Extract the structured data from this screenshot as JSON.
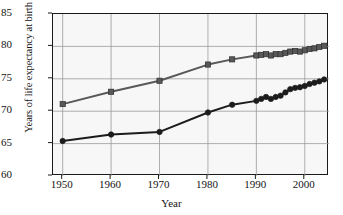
{
  "chart_data": {
    "type": "line",
    "title": "",
    "xlabel": "Year",
    "ylabel": "Years of life expectancy at birth",
    "xlim": [
      1948,
      2005
    ],
    "ylim": [
      60,
      85
    ],
    "xticks": [
      1950,
      1960,
      1970,
      1980,
      1990,
      2000
    ],
    "yticks": [
      60,
      65,
      70,
      75,
      80,
      85
    ],
    "grid": true,
    "legend": "none",
    "plot_background": "#f7f7f7",
    "series": [
      {
        "name": "Upper series (square markers)",
        "color": "#585858",
        "marker": "square",
        "x": [
          1950,
          1960,
          1970,
          1980,
          1985,
          1990,
          1991,
          1992,
          1993,
          1994,
          1995,
          1996,
          1997,
          1998,
          1999,
          2000,
          2001,
          2002,
          2003,
          2004
        ],
        "values": [
          71.1,
          73.0,
          74.7,
          77.2,
          78.0,
          78.6,
          78.7,
          78.8,
          78.6,
          78.8,
          78.8,
          79.0,
          79.2,
          79.3,
          79.2,
          79.4,
          79.6,
          79.7,
          79.9,
          80.1
        ]
      },
      {
        "name": "Lower series (circle markers)",
        "color": "#1c1c1c",
        "marker": "circle",
        "x": [
          1950,
          1960,
          1970,
          1980,
          1985,
          1990,
          1991,
          1992,
          1993,
          1994,
          1995,
          1996,
          1997,
          1998,
          1999,
          2000,
          2001,
          2002,
          2003,
          2004
        ],
        "values": [
          65.4,
          66.4,
          66.8,
          69.8,
          71.0,
          71.6,
          71.9,
          72.2,
          71.9,
          72.2,
          72.4,
          72.9,
          73.4,
          73.6,
          73.7,
          73.9,
          74.2,
          74.4,
          74.6,
          74.9
        ]
      }
    ]
  }
}
